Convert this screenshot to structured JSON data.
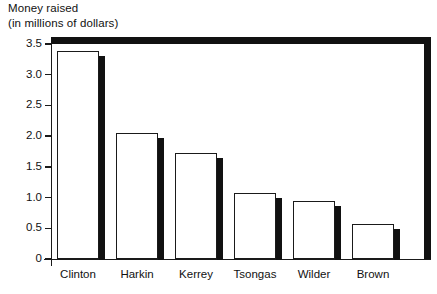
{
  "chart_data": {
    "type": "bar",
    "title": "Money raised",
    "subtitle": "(in millions of dollars)",
    "xlabel": "",
    "ylabel": "",
    "categories": [
      "Clinton",
      "Harkin",
      "Kerrey",
      "Tsongas",
      "Wilder",
      "Brown"
    ],
    "values": [
      3.38,
      2.05,
      1.73,
      1.08,
      0.95,
      0.57
    ],
    "ylim": [
      0,
      3.5
    ],
    "ytick_labels": [
      "3.5",
      "3.0",
      "2.5",
      "2.0",
      "1.5",
      "1.0",
      "0.5",
      "0"
    ],
    "ytick_values": [
      3.5,
      3.0,
      2.5,
      2.0,
      1.5,
      1.0,
      0.5,
      0
    ],
    "grid": false,
    "legend": null,
    "style": {
      "bar_fill": "#ffffff",
      "bar_outline": "#1a1a1a",
      "bar_shadow": "#111111",
      "frame": "#111111",
      "background": "#ffffff"
    }
  }
}
